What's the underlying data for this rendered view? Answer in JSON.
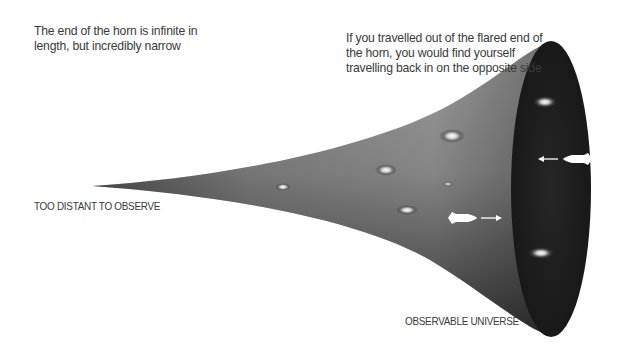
{
  "diagram": {
    "captions": {
      "left": "The end of the horn is infinite in length, but incredibly narrow",
      "right": "If you travelled out of the flared end of the horn, you would find yourself travelling back in on the opposite side"
    },
    "labels": {
      "narrow_end": "TOO DISTANT TO OBSERVE",
      "flared_end": "OBSERVABLE UNIVERSE"
    },
    "elements": {
      "horn": "horn-surface",
      "flared_opening": "dark-ellipse",
      "galaxies": [
        "galaxy",
        "galaxy",
        "galaxy",
        "galaxy",
        "galaxy",
        "galaxy",
        "galaxy"
      ],
      "rockets": [
        {
          "name": "outbound-rocket",
          "direction": "right"
        },
        {
          "name": "returning-rocket",
          "direction": "left"
        }
      ]
    },
    "colors": {
      "text": "#3a3a3a",
      "horn_light": "#b8b8b8",
      "horn_dark": "#2a2a2a",
      "opening": "#1c1c1c",
      "highlight": "#ffffff"
    }
  }
}
